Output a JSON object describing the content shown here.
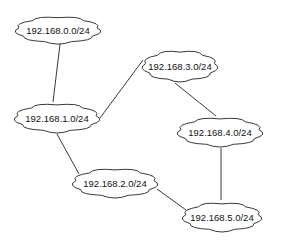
{
  "diagram": {
    "type": "network-topology",
    "nodes": [
      {
        "id": "n0",
        "label": "192.168.0.0/24",
        "cx": 58,
        "cy": 30,
        "w": 86,
        "h": 30
      },
      {
        "id": "n1",
        "label": "192.168.1.0/24",
        "cx": 57,
        "cy": 118,
        "w": 86,
        "h": 32
      },
      {
        "id": "n3",
        "label": "192.168.3.0/24",
        "cx": 180,
        "cy": 66,
        "w": 76,
        "h": 34
      },
      {
        "id": "n4",
        "label": "192.168.4.0/24",
        "cx": 220,
        "cy": 132,
        "w": 86,
        "h": 32
      },
      {
        "id": "n2",
        "label": "192.168.2.0/24",
        "cx": 115,
        "cy": 183,
        "w": 86,
        "h": 32
      },
      {
        "id": "n5",
        "label": "192.168.5.0/24",
        "cx": 222,
        "cy": 217,
        "w": 80,
        "h": 32
      }
    ],
    "edges": [
      {
        "from": "n0",
        "to": "n1",
        "x1": 60,
        "y1": 44,
        "x2": 53,
        "y2": 102
      },
      {
        "from": "n1",
        "to": "n3",
        "x1": 100,
        "y1": 118,
        "x2": 143,
        "y2": 60
      },
      {
        "from": "n3",
        "to": "n4",
        "x1": 175,
        "y1": 83,
        "x2": 216,
        "y2": 116
      },
      {
        "from": "n1",
        "to": "n2",
        "x1": 57,
        "y1": 134,
        "x2": 79,
        "y2": 174
      },
      {
        "from": "n4",
        "to": "n5",
        "x1": 221,
        "y1": 148,
        "x2": 221,
        "y2": 200
      },
      {
        "from": "n2",
        "to": "n5",
        "x1": 157,
        "y1": 189,
        "x2": 186,
        "y2": 210
      }
    ]
  }
}
